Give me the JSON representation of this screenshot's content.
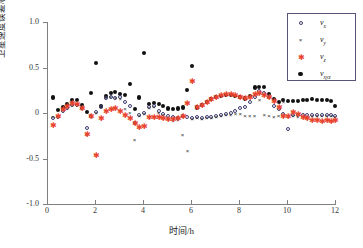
{
  "chart_data": {
    "type": "scatter",
    "title": "",
    "xlabel": "时间/h",
    "ylabel": "卫星速度误差/(10⁻²m/s)",
    "xlim": [
      0,
      12
    ],
    "ylim": [
      -1.0,
      1.0
    ],
    "xticks": [
      "0",
      "2",
      "4",
      "6",
      "8",
      "10",
      "12"
    ],
    "xtick_values": [
      0,
      2,
      4,
      6,
      8,
      10,
      12
    ],
    "yticks": [
      "1.0",
      "0.5",
      "0",
      "-0.5",
      "-1.0"
    ],
    "ytick_values": [
      1.0,
      0.5,
      0,
      -0.5,
      -1.0
    ],
    "grid": false,
    "legend_position": "top-right",
    "series": [
      {
        "name": "v_x",
        "legend_label": "v",
        "legend_sub": "x",
        "marker": "open-circle",
        "color": "#3b3b6e",
        "x": [
          0.25,
          0.45,
          0.65,
          0.85,
          1.05,
          1.25,
          1.45,
          1.65,
          1.85,
          2.05,
          2.25,
          2.45,
          2.65,
          2.85,
          3.05,
          3.25,
          3.45,
          3.65,
          3.85,
          4.05,
          4.25,
          4.45,
          4.65,
          4.85,
          5.05,
          5.25,
          5.45,
          5.65,
          5.85,
          6.05,
          6.25,
          6.45,
          6.65,
          6.85,
          7.05,
          7.25,
          7.45,
          7.65,
          7.85,
          8.05,
          8.25,
          8.45,
          8.65,
          8.85,
          9.05,
          9.25,
          9.45,
          9.65,
          9.85,
          10.05,
          10.25,
          10.45,
          10.65,
          10.85,
          11.05,
          11.25,
          11.45,
          11.65,
          11.85,
          12.0
        ],
        "y": [
          -0.05,
          -0.04,
          0.02,
          0.06,
          0.09,
          0.09,
          0.05,
          -0.17,
          -0.03,
          0.01,
          0.07,
          0.17,
          0.18,
          0.17,
          0.18,
          0.12,
          0.08,
          -0.11,
          -0.02,
          0.0,
          0.07,
          0.08,
          0.02,
          -0.01,
          -0.03,
          -0.04,
          -0.05,
          -0.03,
          -0.04,
          -0.05,
          -0.04,
          -0.05,
          -0.04,
          -0.04,
          -0.03,
          -0.02,
          -0.01,
          0.0,
          0.02,
          0.05,
          0.07,
          0.12,
          0.18,
          0.24,
          0.22,
          0.18,
          0.08,
          0.04,
          -0.01,
          -0.18,
          -0.02,
          -0.02,
          -0.02,
          -0.02,
          -0.02,
          -0.02,
          -0.02,
          -0.02,
          -0.02,
          -0.03
        ]
      },
      {
        "name": "v_y",
        "legend_label": "v",
        "legend_sub": "y",
        "marker": "cross",
        "color": "#2f2f2f",
        "x": [
          0.25,
          0.45,
          0.65,
          0.85,
          1.05,
          1.25,
          1.45,
          1.65,
          1.85,
          2.05,
          2.25,
          2.45,
          2.65,
          2.85,
          3.05,
          3.25,
          3.45,
          3.65,
          3.85,
          4.05,
          4.25,
          4.45,
          4.65,
          4.85,
          5.05,
          5.25,
          5.45,
          5.65,
          5.85,
          6.05,
          6.25,
          6.45,
          6.65,
          6.85,
          7.05,
          7.25,
          7.45,
          7.65,
          7.85,
          8.05,
          8.25,
          8.45,
          8.65,
          8.85,
          9.05,
          9.25,
          9.45,
          9.65,
          9.85,
          10.05,
          10.25,
          10.45,
          10.65,
          10.85,
          11.05,
          11.25,
          11.45,
          11.65,
          11.85,
          12.0
        ],
        "y": [
          -0.05,
          -0.04,
          0.03,
          0.05,
          0.08,
          0.09,
          0.04,
          -0.25,
          -0.05,
          -0.01,
          0.06,
          0.16,
          0.17,
          0.16,
          0.15,
          0.04,
          -0.01,
          -0.3,
          -0.04,
          -0.02,
          0.05,
          0.06,
          0.0,
          -0.03,
          -0.07,
          -0.09,
          -0.08,
          -0.25,
          -0.42,
          -0.07,
          -0.06,
          -0.07,
          -0.06,
          -0.06,
          -0.05,
          -0.04,
          -0.03,
          -0.03,
          -0.02,
          -0.02,
          -0.04,
          -0.04,
          -0.04,
          0.14,
          -0.03,
          -0.04,
          -0.05,
          -0.04,
          0.12,
          -0.05,
          -0.04,
          -0.05,
          -0.05,
          -0.05,
          -0.04,
          -0.04,
          -0.04,
          -0.04,
          -0.04,
          -0.05
        ]
      },
      {
        "name": "v_z",
        "legend_label": "v",
        "legend_sub": "z",
        "marker": "red-star",
        "color": "#e8432c",
        "x": [
          0.25,
          0.45,
          0.65,
          0.85,
          1.05,
          1.25,
          1.45,
          1.65,
          1.85,
          2.05,
          2.25,
          2.45,
          2.65,
          2.85,
          3.05,
          3.25,
          3.45,
          3.65,
          3.85,
          4.05,
          4.25,
          4.45,
          4.65,
          4.85,
          5.05,
          5.25,
          5.45,
          5.65,
          5.85,
          6.05,
          6.25,
          6.45,
          6.65,
          6.85,
          7.05,
          7.25,
          7.45,
          7.65,
          7.85,
          8.05,
          8.25,
          8.45,
          8.65,
          8.85,
          9.05,
          9.25,
          9.45,
          9.65,
          9.85,
          10.05,
          10.25,
          10.45,
          10.65,
          10.85,
          11.05,
          11.25,
          11.45,
          11.65,
          11.85,
          12.0
        ],
        "y": [
          -0.14,
          -0.04,
          0.03,
          0.07,
          0.1,
          0.09,
          0.04,
          -0.24,
          -0.04,
          -0.47,
          -0.07,
          0.01,
          0.03,
          0.04,
          0.01,
          -0.03,
          -0.07,
          -0.12,
          -0.16,
          -0.15,
          -0.06,
          -0.05,
          -0.06,
          -0.07,
          -0.08,
          -0.08,
          -0.07,
          -0.04,
          0.1,
          0.34,
          0.05,
          0.08,
          0.11,
          0.14,
          0.17,
          0.19,
          0.2,
          0.2,
          0.19,
          0.17,
          0.15,
          0.17,
          0.2,
          0.21,
          0.19,
          0.16,
          0.12,
          0.06,
          -0.04,
          -0.04,
          0.0,
          -0.02,
          -0.05,
          -0.07,
          -0.09,
          -0.09,
          -0.1,
          -0.09,
          -0.1,
          -0.09
        ]
      },
      {
        "name": "v_xyz",
        "legend_label": "v",
        "legend_sub": "xyz",
        "marker": "filled-circle",
        "color": "#111111",
        "x": [
          0.25,
          0.45,
          0.65,
          0.85,
          1.05,
          1.25,
          1.45,
          1.65,
          1.85,
          2.05,
          2.25,
          2.45,
          2.65,
          2.85,
          3.05,
          3.25,
          3.45,
          3.65,
          3.85,
          4.05,
          4.25,
          4.45,
          4.65,
          4.85,
          5.05,
          5.25,
          5.45,
          5.65,
          5.85,
          6.05,
          6.25,
          6.45,
          6.65,
          6.85,
          7.05,
          7.25,
          7.45,
          7.65,
          7.85,
          8.05,
          8.25,
          8.45,
          8.65,
          8.85,
          9.05,
          9.25,
          9.45,
          9.65,
          9.85,
          10.05,
          10.25,
          10.45,
          10.65,
          10.85,
          11.05,
          11.25,
          11.45,
          11.65,
          11.85,
          12.0
        ],
        "y": [
          0.17,
          0.03,
          0.06,
          0.1,
          0.14,
          0.14,
          0.09,
          0.01,
          0.22,
          0.55,
          0.08,
          0.19,
          0.22,
          0.23,
          0.21,
          0.2,
          0.32,
          0.04,
          0.17,
          0.66,
          0.1,
          0.11,
          0.1,
          0.08,
          0.05,
          0.04,
          0.05,
          0.06,
          0.25,
          0.52,
          0.06,
          0.09,
          0.12,
          0.15,
          0.18,
          0.19,
          0.2,
          0.2,
          0.19,
          0.18,
          0.16,
          0.19,
          0.28,
          0.29,
          0.29,
          0.21,
          0.15,
          0.12,
          0.14,
          0.13,
          0.13,
          0.13,
          0.14,
          0.14,
          0.15,
          0.14,
          0.14,
          0.14,
          0.13,
          0.08
        ]
      }
    ]
  },
  "axes": {
    "y_title": "卫星速度误差/(10⁻²m/s)",
    "x_title": "时间/h"
  }
}
